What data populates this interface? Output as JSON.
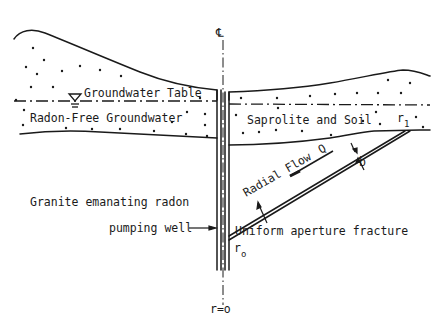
{
  "diagram": {
    "type": "cross-section",
    "colors": {
      "ink": "#1a1a1a",
      "background": "#ffffff"
    },
    "symbols": {
      "centerline": "℄",
      "water_table_marker": "inverted-triangle-icon"
    },
    "labels": {
      "groundwater_table": "Groundwater Table",
      "radon_free_groundwater": "Radon-Free Groundwater",
      "saprolite_and_soil": "Saprolite and Soil",
      "granite": "Granite emanating radon",
      "pumping_well": "pumping well",
      "radial_flow": "Radial Flow",
      "flow_rate": "Q",
      "aperture": "b",
      "fracture": "Uniform aperture fracture",
      "r1_base": "r",
      "r1_sub": "1",
      "r0_base": "r",
      "r0_sub": "o",
      "r_zero": "r=o"
    }
  }
}
